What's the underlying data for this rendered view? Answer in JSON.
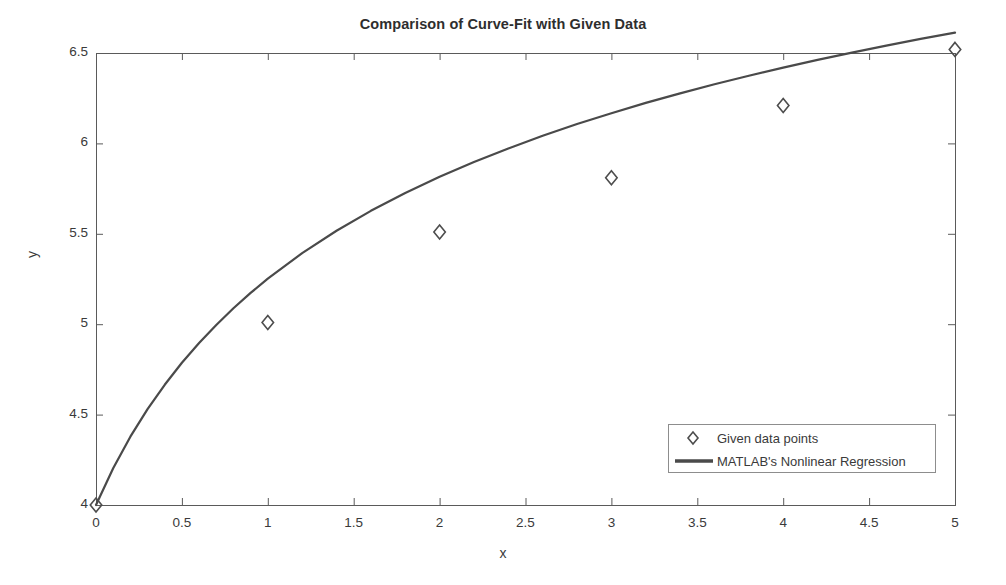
{
  "chart_data": {
    "type": "line",
    "title": "Comparison of Curve-Fit with Given Data",
    "xlabel": "x",
    "ylabel": "y",
    "xlim": [
      0,
      5
    ],
    "ylim": [
      4,
      6.5
    ],
    "xticks": [
      "0",
      "0.5",
      "1",
      "1.5",
      "2",
      "2.5",
      "3",
      "3.5",
      "4",
      "4.5",
      "5"
    ],
    "xtick_values": [
      0,
      0.5,
      1,
      1.5,
      2,
      2.5,
      3,
      3.5,
      4,
      4.5,
      5
    ],
    "yticks": [
      "4",
      "4.5",
      "5",
      "5.5",
      "6",
      "6.5"
    ],
    "ytick_values": [
      4,
      4.5,
      5,
      5.5,
      6,
      6.5
    ],
    "grid": false,
    "legend_position": "lower right",
    "series": [
      {
        "name": "Given data points",
        "type": "scatter",
        "marker": "diamond",
        "color": "#4d4d4d",
        "x": [
          0,
          1,
          2,
          3,
          4,
          5
        ],
        "values": [
          4.0,
          5.01,
          5.51,
          5.81,
          6.21,
          6.52
        ]
      },
      {
        "name": "MATLAB's Nonlinear Regression",
        "type": "line",
        "color": "#4a4a4a",
        "linewidth": 2.2,
        "x": [
          0,
          0.1,
          0.2,
          0.3,
          0.4,
          0.5,
          0.6,
          0.7,
          0.8,
          0.9,
          1.0,
          1.2,
          1.4,
          1.6,
          1.8,
          2.0,
          2.2,
          2.4,
          2.6,
          2.8,
          3.0,
          3.2,
          3.4,
          3.6,
          3.8,
          4.0,
          4.2,
          4.4,
          4.6,
          4.8,
          5.0
        ],
        "values": [
          4.0,
          4.203,
          4.378,
          4.53,
          4.665,
          4.787,
          4.896,
          4.996,
          5.088,
          5.173,
          5.252,
          5.393,
          5.517,
          5.627,
          5.726,
          5.815,
          5.897,
          5.972,
          6.042,
          6.107,
          6.167,
          6.224,
          6.277,
          6.327,
          6.374,
          6.419,
          6.462,
          6.502,
          6.541,
          6.578,
          6.613
        ]
      }
    ]
  },
  "plot_box": {
    "left": 96,
    "top": 53,
    "right": 955,
    "bottom": 505,
    "axis_color": "#5a5a5a"
  },
  "legend": {
    "items": [
      {
        "label": "Given data points",
        "marker": "diamond"
      },
      {
        "label": "MATLAB's Nonlinear Regression",
        "marker": "line"
      }
    ]
  }
}
